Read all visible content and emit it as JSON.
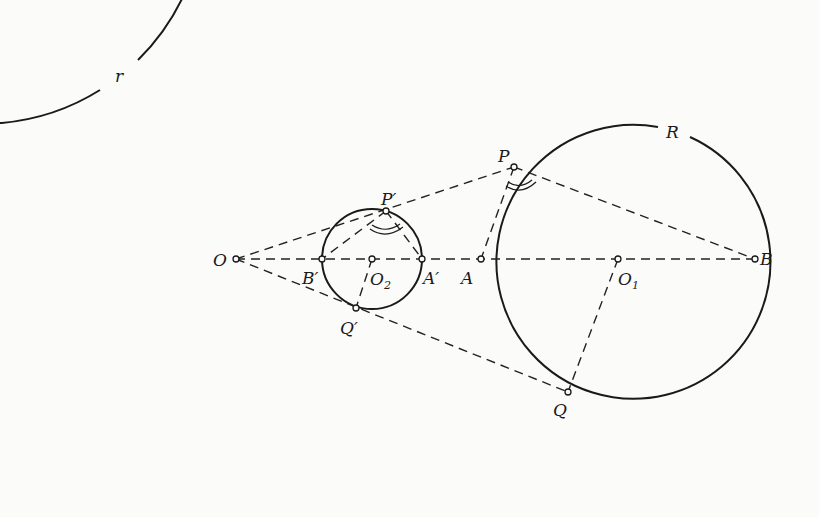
{
  "diagram": {
    "type": "geometric-construction",
    "circles": [
      {
        "id": "big",
        "label": "r",
        "cx": 236,
        "cy": 259,
        "r": 222
      },
      {
        "id": "small",
        "center_label": "O2",
        "cx": 372,
        "cy": 259,
        "r": 50
      },
      {
        "id": "right",
        "label": "R",
        "center_label": "O1",
        "cx": 618,
        "cy": 259,
        "r": 137
      }
    ],
    "labels": {
      "r": "r",
      "R": "R",
      "O": "O",
      "O1": "O",
      "O1_sub": "1",
      "O2": "O",
      "O2_sub": "2",
      "A": "A",
      "B": "B",
      "A_prime": "A′",
      "B_prime": "B′",
      "P": "P",
      "Q": "Q",
      "P_prime": "P′",
      "Q_prime": "Q′"
    },
    "points": {
      "O": [
        236,
        259
      ],
      "O1": [
        618,
        259
      ],
      "O2": [
        372,
        259
      ],
      "A": [
        481,
        259
      ],
      "B": [
        755,
        259
      ],
      "A_prime": [
        422,
        259
      ],
      "B_prime": [
        322,
        259
      ],
      "P": [
        514,
        167
      ],
      "Q": [
        568,
        392
      ],
      "P_prime": [
        386,
        211
      ],
      "Q_prime": [
        356,
        308
      ]
    }
  }
}
